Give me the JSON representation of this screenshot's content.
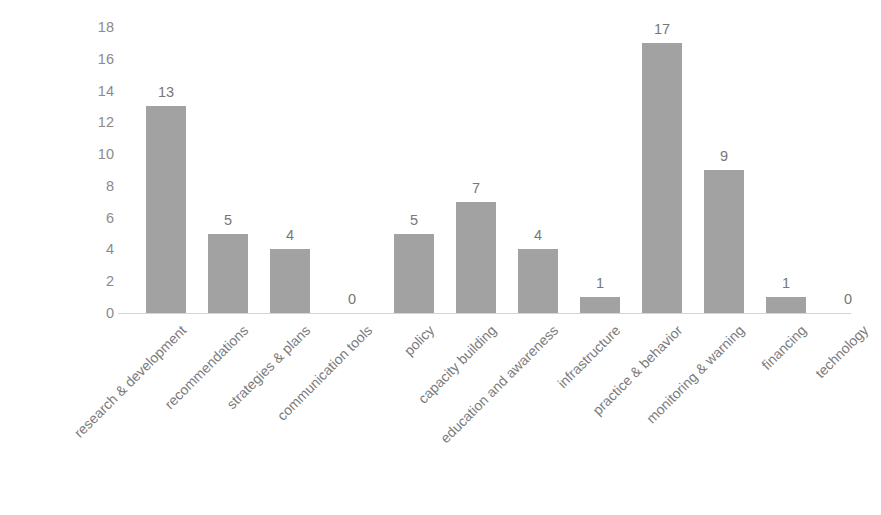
{
  "chart_data": {
    "type": "bar",
    "title": "",
    "xlabel": "",
    "ylabel": "",
    "ylim": [
      0,
      18
    ],
    "grid": false,
    "legend": null,
    "bar_color": "#a2a2a2",
    "axis_color": "#d4d4d4",
    "label_color": "#7b7b7b",
    "tick_color": "#8a8a8a",
    "y_ticks": [
      0,
      2,
      4,
      6,
      8,
      10,
      12,
      14,
      16,
      18
    ],
    "categories": [
      "research & development",
      "recommendations",
      "strategies & plans",
      "communication tools",
      "policy",
      "capacity building",
      "education and awareness",
      "infrastructure",
      "practice & behavior",
      "monitoring & warning",
      "financing",
      "technology"
    ],
    "values": [
      13,
      5,
      4,
      0,
      5,
      7,
      4,
      1,
      17,
      9,
      1,
      0
    ],
    "data_labels": [
      "13",
      "5",
      "4",
      "0",
      "5",
      "7",
      "4",
      "1",
      "17",
      "9",
      "1",
      "0"
    ]
  }
}
